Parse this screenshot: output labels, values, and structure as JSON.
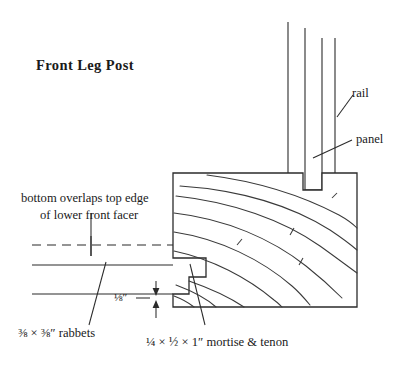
{
  "figure": {
    "title": "Front Leg Post",
    "background_color": "#ffffff",
    "line_color": "#2b2b2b",
    "text_color": "#1a1a1a",
    "width": 415,
    "height": 365
  },
  "labels": {
    "rail": "rail",
    "panel": "panel",
    "overlap_line1": "bottom overlaps top edge",
    "overlap_line2": "of lower front facer",
    "rabbets": "⅜ × ⅜″ rabbets",
    "mortise_tenon": "¼ × ½ × 1″ mortise & tenon",
    "gap_dimension": "⅛″"
  },
  "geometry": {
    "post_block": {
      "x": 173,
      "y": 173,
      "w": 184,
      "h": 134
    },
    "mortise_pocket": {
      "x": 303,
      "y": 173,
      "w": 19,
      "h": 17
    },
    "rabbet_upper_step": {
      "x": 173,
      "y": 258,
      "w": 33,
      "h": 19
    },
    "rabbet_lower_step": {
      "x": 173,
      "y": 277,
      "w": 16,
      "h": 17
    },
    "vertical_members": [
      {
        "name": "rail-left-edge",
        "x": 288,
        "y1": 22,
        "y2": 173
      },
      {
        "name": "rail-right-edge",
        "x": 305,
        "y1": 28,
        "y2": 190
      },
      {
        "name": "panel-left-edge",
        "x": 322,
        "y1": 38,
        "y2": 190
      },
      {
        "name": "panel-right-edge",
        "x": 335,
        "y1": 38,
        "y2": 173
      }
    ],
    "facer_lines": [
      {
        "name": "facer-dashed-centerline",
        "x1": 32,
        "x2": 175,
        "y": 245,
        "style": "dashed"
      },
      {
        "name": "facer-top-edge",
        "x1": 32,
        "x2": 173,
        "y": 265,
        "style": "solid"
      },
      {
        "name": "facer-bottom-edge",
        "x1": 32,
        "x2": 173,
        "y": 294,
        "style": "solid"
      }
    ],
    "tick_mark": {
      "x": 91,
      "y1": 236,
      "y2": 256
    },
    "grain_count": 9
  }
}
